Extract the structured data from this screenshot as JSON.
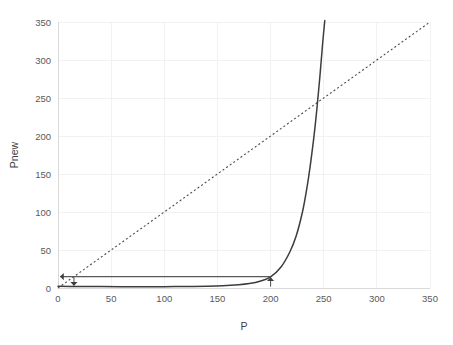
{
  "chart_data": {
    "type": "line",
    "title": "",
    "subtitle": "",
    "xlabel": "P",
    "ylabel": "Pnew",
    "xlim": [
      0,
      350
    ],
    "ylim": [
      0,
      350
    ],
    "xticks": [
      0,
      50,
      100,
      150,
      200,
      250,
      300,
      350
    ],
    "yticks": [
      0,
      50,
      100,
      150,
      200,
      250,
      300,
      350
    ],
    "xtick_labels": [
      "0",
      "50",
      "100",
      "150",
      "200",
      "250",
      "300",
      "350"
    ],
    "ytick_labels": [
      "0",
      "50",
      "100",
      "150",
      "200",
      "250",
      "300",
      "350"
    ],
    "grid": true,
    "legend": false,
    "legend_position": "none",
    "series": [
      {
        "name": "identity",
        "style": "dashed",
        "color": "#4a4a4a",
        "description": "Pnew = P reference diagonal",
        "x": [
          0,
          350
        ],
        "values": [
          0,
          350
        ]
      },
      {
        "name": "map",
        "style": "solid",
        "color": "#3d3d3d",
        "description": "Update map curve, flat then exponential rise",
        "x": [
          0,
          20,
          40,
          60,
          80,
          100,
          120,
          140,
          155,
          170,
          180,
          190,
          200,
          210,
          218,
          224,
          230,
          234,
          238,
          242,
          246,
          249,
          251
        ],
        "values": [
          2.2,
          2.0,
          1.9,
          1.8,
          1.8,
          1.8,
          1.9,
          2.2,
          2.8,
          4.2,
          5.8,
          8.8,
          14.5,
          28,
          47,
          68,
          100,
          130,
          168,
          214,
          272,
          322,
          352
        ]
      }
    ],
    "annotations": [
      {
        "name": "cobweb-horizontal",
        "kind": "arrow",
        "from": [
          200,
          15
        ],
        "to": [
          2,
          15
        ],
        "head": "left"
      },
      {
        "name": "cobweb-up",
        "kind": "arrow",
        "from": [
          200,
          2
        ],
        "to": [
          200,
          14
        ],
        "head": "up"
      },
      {
        "name": "cobweb-down",
        "kind": "arrow",
        "from": [
          15,
          14
        ],
        "to": [
          15,
          3
        ],
        "head": "down"
      }
    ],
    "fixed_point": {
      "label": "",
      "x": 243,
      "y": 243
    },
    "colors": {
      "background": "#ffffff",
      "grid": "#f2f2f2",
      "axis": "#d9d9d9",
      "text": "#595959",
      "series_solid": "#3d3d3d",
      "series_dashed": "#4a4a4a"
    }
  }
}
